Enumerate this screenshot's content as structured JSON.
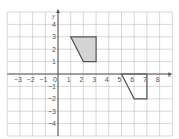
{
  "diagram": {
    "type": "coordinate-grid",
    "x_range": [
      -4,
      9
    ],
    "y_range": [
      -5,
      5
    ],
    "x_axis_label": "x",
    "y_axis_label": "y",
    "x_tick_labels": [
      {
        "v": -3,
        "t": "−3"
      },
      {
        "v": -2,
        "t": "−2"
      },
      {
        "v": -1,
        "t": "−1"
      },
      {
        "v": 0,
        "t": "0"
      },
      {
        "v": 1,
        "t": "1"
      },
      {
        "v": 2,
        "t": "2"
      },
      {
        "v": 3,
        "t": "3"
      },
      {
        "v": 4,
        "t": "4"
      },
      {
        "v": 5,
        "t": "5"
      },
      {
        "v": 6,
        "t": "6"
      },
      {
        "v": 7,
        "t": "7"
      },
      {
        "v": 8,
        "t": "8"
      }
    ],
    "y_tick_labels": [
      {
        "v": 4,
        "t": "4"
      },
      {
        "v": 3,
        "t": "3"
      },
      {
        "v": 2,
        "t": "2"
      },
      {
        "v": 1,
        "t": "1"
      },
      {
        "v": -1,
        "t": "−1"
      },
      {
        "v": -2,
        "t": "−2"
      },
      {
        "v": -3,
        "t": "−3"
      },
      {
        "v": -4,
        "t": "−4"
      }
    ],
    "shapes": [
      {
        "name": "shaded-quadrilateral",
        "vertices": [
          [
            1,
            3
          ],
          [
            3,
            3
          ],
          [
            3,
            1
          ],
          [
            2,
            1
          ]
        ],
        "fill": "#d4d4d4",
        "stroke": "#555555"
      },
      {
        "name": "outline-quadrilateral",
        "vertices": [
          [
            5,
            0
          ],
          [
            7,
            0
          ],
          [
            7,
            -2
          ],
          [
            6,
            -2
          ]
        ],
        "fill": "none",
        "stroke": "#555555"
      }
    ],
    "colors": {
      "grid": "#bdbdbd",
      "axis": "#555555",
      "shape_fill": "#d4d4d4"
    }
  }
}
